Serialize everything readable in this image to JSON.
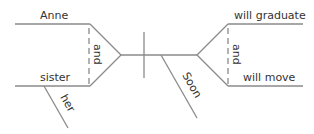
{
  "diagram": {
    "type": "sentence-diagram",
    "line_color": "#8a8a8a",
    "text_color": "#333333",
    "subject": {
      "compound": [
        "Anne",
        "sister"
      ],
      "conjunction": "and",
      "modifiers": {
        "sister": "her"
      }
    },
    "predicate": {
      "compound": [
        "will graduate",
        "will move"
      ],
      "conjunction": "and",
      "modifier": "Soon"
    }
  }
}
